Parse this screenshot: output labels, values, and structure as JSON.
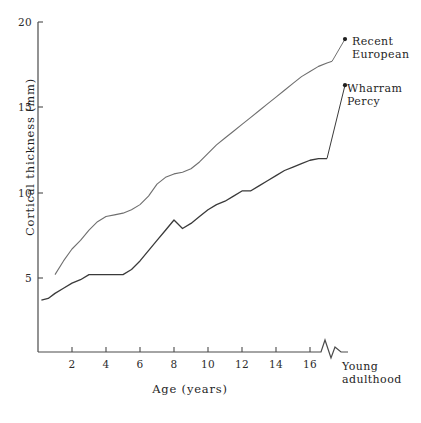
{
  "chart_data": {
    "type": "line",
    "title": "",
    "xlabel": "Age (years)",
    "ylabel": "Cortical thickness (mm)",
    "xlim": [
      0,
      17.5
    ],
    "ylim": [
      0,
      20
    ],
    "grid": false,
    "legend_position": "inline-right-annotations",
    "xticks": [
      2,
      4,
      6,
      8,
      10,
      12,
      14,
      16
    ],
    "xtick_labels": [
      "2",
      "4",
      "6",
      "8",
      "10",
      "12",
      "14",
      "16"
    ],
    "yticks": [
      5,
      10,
      15,
      20
    ],
    "ytick_labels": [
      "5",
      "10",
      "15",
      "20"
    ],
    "axis_break": {
      "label": "Young\nadulthood",
      "symbol": "zigzag",
      "axis": "x"
    },
    "annotations": [
      {
        "id": "recent-european",
        "label": "Recent\nEuropean",
        "marker": "dot"
      },
      {
        "id": "wharram-percy",
        "label": "Wharram\nPercy",
        "marker": "dot"
      }
    ],
    "series": [
      {
        "name": "Recent European",
        "color": "#6f6f6f",
        "x": [
          1.0,
          1.5,
          2.0,
          2.5,
          3.0,
          3.5,
          4.0,
          4.5,
          5.0,
          5.5,
          6.0,
          6.5,
          7.0,
          7.5,
          8.0,
          8.5,
          9.0,
          9.5,
          10.0,
          10.5,
          11.0,
          11.5,
          12.0,
          12.5,
          13.0,
          13.5,
          14.0,
          14.5,
          15.0,
          15.5,
          16.0,
          16.5,
          17.0,
          17.3
        ],
        "values": [
          5.2,
          6.0,
          6.7,
          7.2,
          7.8,
          8.3,
          8.6,
          8.7,
          8.8,
          9.0,
          9.3,
          9.8,
          10.5,
          10.9,
          11.1,
          11.2,
          11.4,
          11.8,
          12.3,
          12.8,
          13.2,
          13.6,
          14.0,
          14.4,
          14.8,
          15.2,
          15.6,
          16.0,
          16.4,
          16.8,
          17.1,
          17.4,
          17.6,
          17.7
        ]
      },
      {
        "name": "Wharram Percy",
        "color": "#3a3a3a",
        "x": [
          0.2,
          0.6,
          1.0,
          1.5,
          2.0,
          2.5,
          3.0,
          3.5,
          4.0,
          4.5,
          5.0,
          5.5,
          6.0,
          6.5,
          7.0,
          7.5,
          8.0,
          8.5,
          9.0,
          9.5,
          10.0,
          10.5,
          11.0,
          11.5,
          12.0,
          12.5,
          13.0,
          13.5,
          14.0,
          14.5,
          15.0,
          15.5,
          16.0,
          16.5,
          17.0
        ],
        "values": [
          3.7,
          3.8,
          4.1,
          4.4,
          4.7,
          4.9,
          5.2,
          5.2,
          5.2,
          5.2,
          5.2,
          5.5,
          6.0,
          6.6,
          7.2,
          7.8,
          8.4,
          7.9,
          8.2,
          8.6,
          9.0,
          9.3,
          9.5,
          9.8,
          10.1,
          10.1,
          10.4,
          10.7,
          11.0,
          11.3,
          11.5,
          11.7,
          11.9,
          12.0,
          12.0
        ]
      }
    ],
    "adult_endpoints": [
      {
        "series": "Recent European",
        "value": 19.0
      },
      {
        "series": "Wharram Percy",
        "value": 16.3
      }
    ]
  }
}
